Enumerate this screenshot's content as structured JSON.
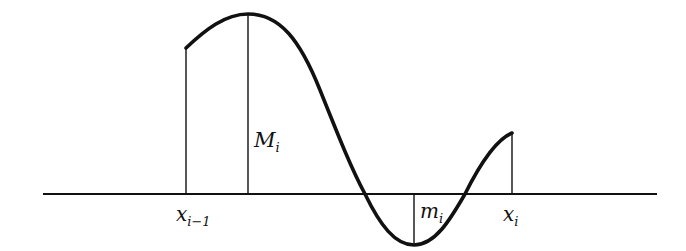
{
  "diagram": {
    "labels": {
      "x_left": {
        "main": "x",
        "sub": "i−1"
      },
      "x_right": {
        "main": "x",
        "sub": "i"
      },
      "sup": {
        "main": "M",
        "sub": "i"
      },
      "inf": {
        "main": "m",
        "sub": "i"
      }
    },
    "colors": {
      "stroke": "#111111",
      "background": "#ffffff"
    }
  }
}
